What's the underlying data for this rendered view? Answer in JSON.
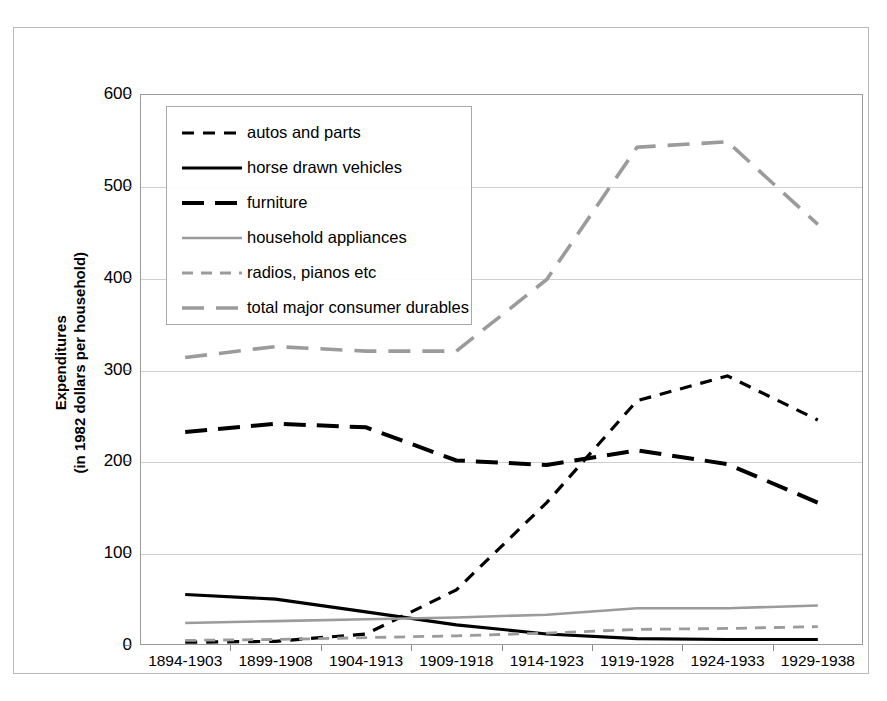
{
  "chart_data": {
    "type": "line",
    "title": "",
    "xlabel": "",
    "ylabel_line1": "Expenditures",
    "ylabel_line2": "(in 1982 dollars per household)",
    "categories": [
      "1894-1903",
      "1899-1908",
      "1904-1913",
      "1909-1918",
      "1914-1923",
      "1919-1928",
      "1924-1933",
      "1929-1938"
    ],
    "ylim": [
      0,
      600
    ],
    "yticks": [
      0,
      100,
      200,
      300,
      400,
      500,
      600
    ],
    "ytick_labels": [
      "0",
      "100",
      "200",
      "300",
      "400",
      "500",
      "600"
    ],
    "grid": true,
    "legend_position": "upper-left-inside",
    "series": [
      {
        "name": "autos and parts",
        "values": [
          3,
          4,
          12,
          60,
          155,
          266,
          293,
          245
        ],
        "color": "#000000",
        "dash": "12,9",
        "width": 3.2
      },
      {
        "name": "horse drawn vehicles",
        "values": [
          55,
          50,
          36,
          22,
          12,
          7,
          6,
          6
        ],
        "color": "#000000",
        "dash": "none",
        "width": 3.2
      },
      {
        "name": "furniture",
        "values": [
          232,
          241,
          237,
          201,
          196,
          212,
          197,
          155
        ],
        "color": "#000000",
        "dash": "22,11",
        "width": 4.0
      },
      {
        "name": "household appliances",
        "values": [
          24,
          26,
          28,
          30,
          33,
          40,
          40,
          43
        ],
        "color": "#9b9b9b",
        "dash": "none",
        "width": 2.6
      },
      {
        "name": "radios, pianos etc",
        "values": [
          5,
          6,
          8,
          10,
          13,
          17,
          18,
          20
        ],
        "color": "#9b9b9b",
        "dash": "11,8",
        "width": 2.8
      },
      {
        "name": "total major consumer durables",
        "values": [
          313,
          325,
          320,
          320,
          398,
          542,
          548,
          458
        ],
        "color": "#9b9b9b",
        "dash": "22,12",
        "width": 3.6
      }
    ]
  },
  "colors": {
    "black": "#000000",
    "gray": "#9b9b9b",
    "gridline": "#cfcfcf",
    "frame": "#9a9a9a",
    "outer_border": "#b9b9b9",
    "background": "#ffffff"
  }
}
